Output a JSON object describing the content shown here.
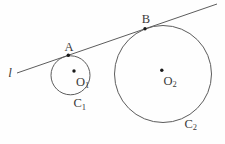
{
  "figure": {
    "type": "geometry-diagram",
    "line": {
      "label": "l"
    },
    "tangent_points": {
      "a": {
        "label": "A"
      },
      "b": {
        "label": "B"
      }
    },
    "centers": {
      "o1": {
        "base": "O",
        "sub": "1"
      },
      "o2": {
        "base": "O",
        "sub": "2"
      }
    },
    "circles": {
      "c1": {
        "base": "C",
        "sub": "1"
      },
      "c2": {
        "base": "C",
        "sub": "2"
      }
    },
    "colors": {
      "stroke": "#5c5c5c",
      "text": "#3a3a3a",
      "dot": "#1a1a1a",
      "background": "#fefefe"
    }
  }
}
